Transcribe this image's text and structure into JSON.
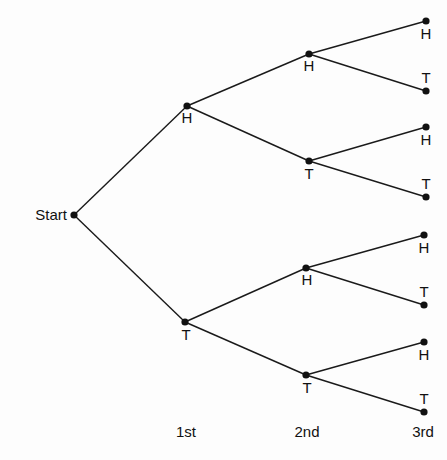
{
  "diagram": {
    "type": "probability-tree",
    "start_label": "Start",
    "level_labels": [
      "1st",
      "2nd",
      "3rd"
    ],
    "nodes": [
      {
        "id": "start",
        "label": "Start",
        "x": 74,
        "y": 215
      },
      {
        "id": "1H",
        "label": "H",
        "x": 187,
        "y": 106
      },
      {
        "id": "1T",
        "label": "T",
        "x": 185,
        "y": 322
      },
      {
        "id": "2HH",
        "label": "H",
        "x": 309,
        "y": 54
      },
      {
        "id": "2HT",
        "label": "T",
        "x": 309,
        "y": 161
      },
      {
        "id": "2TH",
        "label": "H",
        "x": 306,
        "y": 268
      },
      {
        "id": "2TT",
        "label": "T",
        "x": 306,
        "y": 375
      },
      {
        "id": "3HHH",
        "label": "H",
        "x": 426,
        "y": 21
      },
      {
        "id": "3HHT",
        "label": "T",
        "x": 426,
        "y": 91
      },
      {
        "id": "3HTH",
        "label": "H",
        "x": 426,
        "y": 127
      },
      {
        "id": "3HTT",
        "label": "T",
        "x": 426,
        "y": 197
      },
      {
        "id": "3THH",
        "label": "H",
        "x": 424,
        "y": 235
      },
      {
        "id": "3THT",
        "label": "T",
        "x": 424,
        "y": 305
      },
      {
        "id": "3TTH",
        "label": "H",
        "x": 424,
        "y": 342
      },
      {
        "id": "3TTT",
        "label": "T",
        "x": 424,
        "y": 412
      }
    ],
    "edges": [
      [
        "start",
        "1H"
      ],
      [
        "start",
        "1T"
      ],
      [
        "1H",
        "2HH"
      ],
      [
        "1H",
        "2HT"
      ],
      [
        "1T",
        "2TH"
      ],
      [
        "1T",
        "2TT"
      ],
      [
        "2HH",
        "3HHH"
      ],
      [
        "2HH",
        "3HHT"
      ],
      [
        "2HT",
        "3HTH"
      ],
      [
        "2HT",
        "3HTT"
      ],
      [
        "2TH",
        "3THH"
      ],
      [
        "2TH",
        "3THT"
      ],
      [
        "2TT",
        "3TTH"
      ],
      [
        "2TT",
        "3TTT"
      ]
    ]
  }
}
